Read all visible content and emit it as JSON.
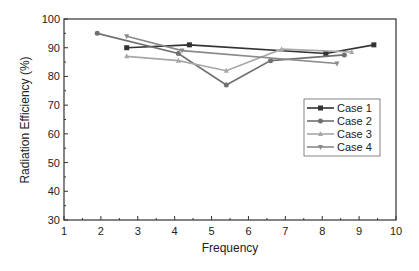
{
  "chart_data": {
    "type": "line",
    "title": "",
    "xlabel": "Frequency",
    "ylabel": "Radiation Efficiency (%)",
    "xlim": [
      1,
      10
    ],
    "ylim": [
      30,
      100
    ],
    "xticks": [
      1,
      2,
      3,
      4,
      5,
      6,
      7,
      8,
      9,
      10
    ],
    "yticks": [
      30,
      40,
      50,
      60,
      70,
      80,
      90,
      100
    ],
    "grid": false,
    "legend_position": "right-middle",
    "series": [
      {
        "name": "Case 1",
        "color": "#333333",
        "marker": "square",
        "x": [
          2.7,
          4.4,
          8.1,
          9.4
        ],
        "y": [
          90,
          91,
          88,
          91
        ]
      },
      {
        "name": "Case 2",
        "color": "#707070",
        "marker": "circle",
        "x": [
          1.9,
          4.1,
          5.4,
          6.6,
          8.6
        ],
        "y": [
          95,
          88,
          77,
          85.5,
          87.5
        ]
      },
      {
        "name": "Case 3",
        "color": "#a8a8a8",
        "marker": "triangle-up",
        "x": [
          2.7,
          4.1,
          5.4,
          6.9,
          8.8
        ],
        "y": [
          87,
          85.5,
          82,
          89.5,
          88.5
        ]
      },
      {
        "name": "Case 4",
        "color": "#8a8a8a",
        "marker": "triangle-down",
        "x": [
          2.7,
          4.2,
          8.4
        ],
        "y": [
          94,
          89,
          84.5
        ]
      }
    ]
  }
}
